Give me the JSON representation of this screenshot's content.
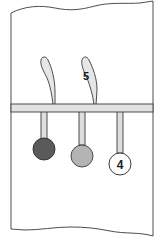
{
  "diagram": {
    "labels": {
      "upper_right_lobe": "5",
      "right_pendant_ball": "4"
    },
    "colors": {
      "outline": "#3a3a3a",
      "bar_fill": "#e2e2e2",
      "lobe_fill": "#e6e6e6",
      "stem_fill": "#dedede",
      "ball_dark": "#5a5a5a",
      "ball_medium": "#b4b4b4",
      "ball_light": "#ffffff"
    },
    "elements": [
      {
        "id": "upper-left-lobe",
        "shape": "teardrop",
        "label": ""
      },
      {
        "id": "upper-right-lobe",
        "shape": "teardrop",
        "label": "5"
      },
      {
        "id": "horizontal-bar",
        "shape": "bar",
        "label": ""
      },
      {
        "id": "pendant-left",
        "shape": "stem-ball",
        "ball_shade": "dark",
        "label": ""
      },
      {
        "id": "pendant-middle",
        "shape": "stem-ball",
        "ball_shade": "medium",
        "label": ""
      },
      {
        "id": "pendant-right",
        "shape": "stem-ball",
        "ball_shade": "light",
        "label": "4"
      }
    ]
  }
}
